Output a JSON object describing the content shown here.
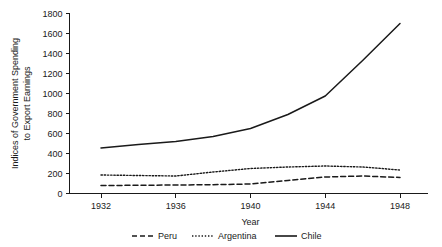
{
  "chart_data": {
    "type": "line",
    "title": "",
    "xlabel": "Year",
    "ylabel": "Indices of Government Spending to Export Earnings",
    "ylabel_line1": "Indices of Government Spending",
    "ylabel_line2": "to Export Earnings",
    "x": [
      1932,
      1934,
      1936,
      1938,
      1940,
      1942,
      1944,
      1946,
      1948
    ],
    "xlim": [
      1931,
      1949
    ],
    "ylim": [
      0,
      1800
    ],
    "xticks": [
      1932,
      1936,
      1940,
      1944,
      1948
    ],
    "xtick_labels": [
      "1932",
      "1936",
      "1940",
      "1944",
      "1948"
    ],
    "yticks": [
      0,
      200,
      400,
      600,
      800,
      1000,
      1200,
      1400,
      1600,
      1800
    ],
    "ytick_labels": [
      "0",
      "200",
      "400",
      "600",
      "800",
      "1000",
      "1200",
      "1400",
      "1600",
      "1800"
    ],
    "grid": false,
    "legend_position": "below",
    "series": [
      {
        "name": "Peru",
        "style": "dashed",
        "color": "#1a1a1a",
        "values": [
          80,
          82,
          85,
          88,
          95,
          130,
          165,
          175,
          160
        ]
      },
      {
        "name": "Argentina",
        "style": "dotted",
        "color": "#1a1a1a",
        "values": [
          185,
          180,
          175,
          215,
          250,
          265,
          275,
          265,
          235
        ]
      },
      {
        "name": "Chile",
        "style": "solid",
        "color": "#1a1a1a",
        "values": [
          455,
          490,
          520,
          570,
          650,
          790,
          975,
          1330,
          1700
        ]
      }
    ],
    "legend": [
      "Peru",
      "Argentina",
      "Chile"
    ]
  }
}
